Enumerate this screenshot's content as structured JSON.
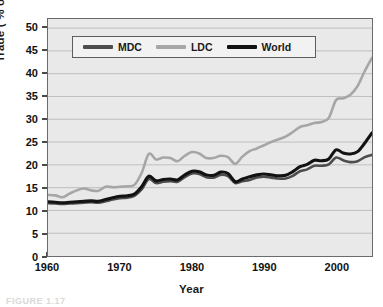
{
  "chart_data": {
    "type": "line",
    "title": "",
    "xlabel": "Year",
    "ylabel": "Trade ( % of GDP)",
    "xlim": [
      1960,
      2005
    ],
    "ylim": [
      0,
      52
    ],
    "ytick_labels": [
      "0",
      "5",
      "10",
      "15",
      "20",
      "25",
      "30",
      "35",
      "40",
      "45",
      "50"
    ],
    "ytick_values": [
      0,
      5,
      10,
      15,
      20,
      25,
      30,
      35,
      40,
      45,
      50
    ],
    "xtick_labels": [
      "1960",
      "1970",
      "1980",
      "1990",
      "2000"
    ],
    "xtick_values": [
      1960,
      1970,
      1980,
      1990,
      2000
    ],
    "grid": "horizontal",
    "legend_position": "top-left-inside",
    "x": [
      1960,
      1961,
      1962,
      1963,
      1964,
      1965,
      1966,
      1967,
      1968,
      1969,
      1970,
      1971,
      1972,
      1973,
      1974,
      1975,
      1976,
      1977,
      1978,
      1979,
      1980,
      1981,
      1982,
      1983,
      1984,
      1985,
      1986,
      1987,
      1988,
      1989,
      1990,
      1991,
      1992,
      1993,
      1994,
      1995,
      1996,
      1997,
      1998,
      1999,
      2000,
      2001,
      2002,
      2003,
      2004,
      2005
    ],
    "series": [
      {
        "name": "MDC",
        "color": "#4d4d4d",
        "values": [
          11.6,
          11.5,
          11.4,
          11.5,
          11.6,
          11.7,
          11.8,
          11.7,
          12.0,
          12.4,
          12.7,
          12.8,
          13.2,
          14.6,
          16.9,
          16.0,
          16.3,
          16.4,
          16.3,
          17.3,
          18.1,
          18.0,
          17.3,
          17.2,
          17.8,
          17.5,
          16.0,
          16.4,
          16.7,
          17.2,
          17.4,
          17.2,
          17.0,
          17.0,
          17.6,
          18.6,
          19.0,
          19.8,
          19.8,
          20.1,
          21.6,
          21.0,
          20.6,
          20.8,
          21.7,
          22.2
        ]
      },
      {
        "name": "LDC",
        "color": "#a6a6a6",
        "values": [
          13.4,
          13.3,
          12.9,
          13.7,
          14.4,
          14.8,
          14.4,
          14.3,
          15.2,
          15.1,
          15.2,
          15.3,
          15.6,
          18.2,
          22.4,
          21.2,
          21.6,
          21.5,
          20.8,
          22.0,
          22.8,
          22.5,
          21.5,
          21.5,
          22.0,
          21.7,
          20.2,
          21.8,
          23.0,
          23.6,
          24.3,
          25.0,
          25.6,
          26.2,
          27.2,
          28.3,
          28.7,
          29.2,
          29.4,
          30.3,
          34.2,
          34.6,
          35.4,
          37.3,
          40.6,
          43.5
        ]
      },
      {
        "name": "World",
        "color": "#121212",
        "values": [
          11.9,
          11.8,
          11.7,
          11.8,
          11.9,
          12.0,
          12.1,
          12.0,
          12.4,
          12.8,
          13.1,
          13.2,
          13.6,
          15.2,
          17.5,
          16.5,
          16.8,
          16.9,
          16.7,
          17.8,
          18.6,
          18.5,
          17.8,
          17.7,
          18.4,
          18.1,
          16.3,
          16.9,
          17.4,
          17.8,
          18.0,
          17.8,
          17.6,
          17.7,
          18.5,
          19.6,
          20.1,
          21.0,
          20.9,
          21.3,
          23.3,
          22.6,
          22.4,
          22.9,
          24.8,
          27.0
        ]
      }
    ]
  },
  "legend": {
    "items": [
      {
        "label": "MDC",
        "color": "#4d4d4d"
      },
      {
        "label": "LDC",
        "color": "#a6a6a6"
      },
      {
        "label": "World",
        "color": "#121212"
      }
    ]
  },
  "axes": {
    "y_title": "Trade ( % of GDP)",
    "x_title": "Year"
  },
  "caption": {
    "text": "FIGURE 1.17"
  }
}
